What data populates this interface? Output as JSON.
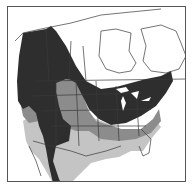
{
  "map": {
    "type": "species-range-map",
    "region": "North America",
    "colors": {
      "background": "#ffffff",
      "outside_range": "#ffffff",
      "range_dark": "#2e2e2e",
      "range_medium": "#8c8c8c",
      "range_light": "#c4c4c4",
      "borders": "#3a3a3a",
      "frame": "#555555"
    },
    "zones": [
      {
        "id": "dark",
        "description": "dark shaded range (west, Great Plains corridor, northeast)"
      },
      {
        "id": "medium",
        "description": "medium gray range (interior west, southeast band)"
      },
      {
        "id": "light",
        "description": "light gray range (south, Mexico, southeast)"
      }
    ]
  }
}
